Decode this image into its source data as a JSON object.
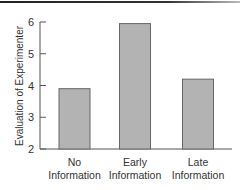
{
  "chart_data": {
    "type": "bar",
    "title": "",
    "xlabel": "",
    "ylabel": "Evaluation of Experimenter",
    "categories": [
      "No Information",
      "Early Information",
      "Late Information"
    ],
    "category_lines": [
      [
        "No",
        "Information"
      ],
      [
        "Early",
        "Information"
      ],
      [
        "Late",
        "Information"
      ]
    ],
    "values": [
      3.9,
      5.95,
      4.2
    ],
    "ylim": [
      2,
      6
    ],
    "yticks": [
      2,
      3,
      4,
      5,
      6
    ],
    "grid": false,
    "legend": null,
    "bar_color": "#b3b3b3",
    "bar_edge_color": "#666666"
  }
}
